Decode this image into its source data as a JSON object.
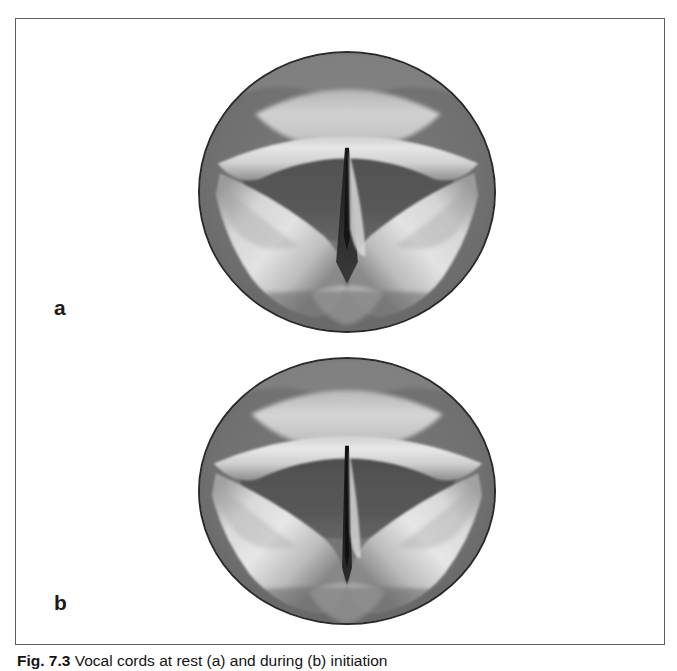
{
  "figure": {
    "frame": {
      "border_color": "#5c5f63",
      "background": "#ffffff"
    },
    "panels": [
      {
        "id": "a",
        "label": "a",
        "view_type": "laryngoscopic-view",
        "subject": "vocal cords",
        "glottis_state": "open / abducted",
        "colors": {
          "mucosa_background": "#6f6f6f",
          "vocal_fold_highlight": "#dcdcdc",
          "airway_shadow": "#4a4a4a",
          "glottic_slit": "#232323",
          "rim": "#2a2a2a"
        }
      },
      {
        "id": "b",
        "label": "b",
        "view_type": "laryngoscopic-view",
        "subject": "vocal cords",
        "glottis_state": "narrowed / adducting",
        "colors": {
          "mucosa_background": "#6f6f6f",
          "vocal_fold_highlight": "#dcdcdc",
          "airway_shadow": "#4a4a4a",
          "glottic_slit": "#1c1c1c",
          "rim": "#2a2a2a"
        }
      }
    ],
    "caption": {
      "number": "Fig. 7.3",
      "text": "Vocal cords at rest (a) and during (b) initiation",
      "marker_a": "a",
      "marker_b": "b",
      "clipped": true
    }
  }
}
